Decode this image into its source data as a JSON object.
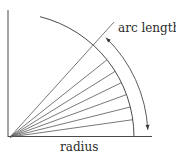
{
  "labels": {
    "arc_length": "arc length",
    "radius": "radius"
  },
  "geometry": {
    "origin": [
      10,
      137
    ],
    "radius": 124,
    "radial_angles_deg": [
      45,
      38.5,
      32,
      26,
      20,
      14,
      8
    ],
    "long_line_end": [
      114,
      22
    ],
    "arc_start_deg": 0,
    "arc_end_deg": 76,
    "arrow_arc_radius": 138,
    "arrow_arc_start_deg": 3,
    "arrow_arc_end_deg": 46,
    "baseline_end_x": 152,
    "vertical_axis_top_y": 10
  },
  "colors": {
    "line": "#4a4a4a",
    "text": "#2a2a2a"
  }
}
